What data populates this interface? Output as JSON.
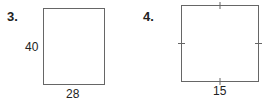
{
  "problems": [
    {
      "number": "3.",
      "shape": "rectangle",
      "side_label": "40",
      "bottom_label": "28"
    },
    {
      "number": "4.",
      "shape": "square",
      "bottom_label": "15",
      "tick_marks": 4
    }
  ],
  "colors": {
    "stroke": "#555555",
    "text": "#222222"
  }
}
